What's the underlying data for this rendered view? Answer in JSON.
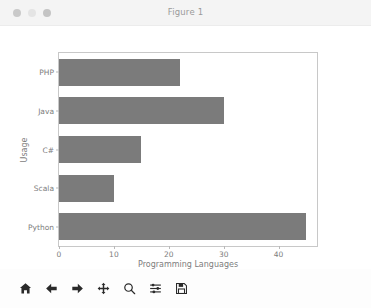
{
  "window": {
    "title": "Figure 1",
    "controls": [
      {
        "name": "close",
        "color": "#c9c9c9"
      },
      {
        "name": "minimize",
        "color": "#e4e4e4"
      },
      {
        "name": "maximize",
        "color": "#c4c4c4"
      }
    ]
  },
  "chart_data": {
    "type": "bar",
    "orientation": "horizontal",
    "title": "",
    "categories": [
      "Python",
      "Scala",
      "C#",
      "Java",
      "PHP"
    ],
    "values": [
      45,
      10,
      15,
      30,
      22
    ],
    "xlabel": "Programming Languages",
    "ylabel": "Usage",
    "xlim": [
      0,
      47
    ],
    "xticks": [
      0,
      10,
      20,
      30,
      40
    ],
    "xtick_labels": [
      "0",
      "10",
      "20",
      "30",
      "40"
    ],
    "grid": false,
    "legend": null,
    "bar_color": "#7b7b7b",
    "axes_edge_color": "#c8c8c8",
    "tick_label_color": "#7d7d7d"
  },
  "toolbar": {
    "buttons": [
      {
        "name": "home-icon",
        "tooltip": "Home"
      },
      {
        "name": "arrow-left-icon",
        "tooltip": "Back"
      },
      {
        "name": "arrow-right-icon",
        "tooltip": "Forward"
      },
      {
        "name": "move-icon",
        "tooltip": "Pan"
      },
      {
        "name": "magnifier-icon",
        "tooltip": "Zoom"
      },
      {
        "name": "sliders-icon",
        "tooltip": "Configure subplots"
      },
      {
        "name": "floppy-disk-icon",
        "tooltip": "Save"
      }
    ]
  }
}
